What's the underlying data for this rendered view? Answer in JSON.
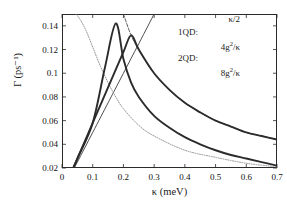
{
  "figure": {
    "background": "#ffffff",
    "axis_color": "#2b2b2b"
  },
  "axes": {
    "xlabel": "κ (meV)",
    "ylabel": "Γ (ps⁻¹)",
    "xticks": [
      "0",
      "0.1",
      "0.2",
      "0.3",
      "0.4",
      "0.5",
      "0.6",
      "0.7"
    ],
    "yticks": [
      "0.02",
      "0.04",
      "0.06",
      "0.08",
      "0.1",
      "0.12",
      "0.14"
    ],
    "xlim": [
      0,
      0.7
    ],
    "ylim": [
      0.02,
      0.15
    ]
  },
  "legend": {
    "group1_label": "1QD:",
    "group2_label": "2QD:",
    "entries": [
      {
        "label": "κ/2",
        "style": "solid-thin",
        "color": "#2b2b2b"
      },
      {
        "label": "4g²/κ",
        "style": "solid-thick",
        "color": "#2b2b2b"
      },
      {
        "label": "8g²/κ",
        "style": "dotted",
        "color": "#6b6b6b"
      }
    ],
    "line_styles": [
      "solid-thin",
      "solid-thick",
      "dotted",
      "dashed"
    ]
  },
  "chart_data": {
    "type": "line",
    "title": "",
    "xlabel": "κ (meV)",
    "ylabel": "Γ (ps⁻¹)",
    "xlim": [
      0,
      0.7
    ],
    "ylim": [
      0.02,
      0.15
    ],
    "grid": false,
    "legend_position": "top-right",
    "series": [
      {
        "name": "κ/2",
        "style": "solid-thin",
        "color": "#3a3a3a",
        "x": [
          0.02,
          0.05,
          0.1,
          0.15,
          0.175,
          0.2,
          0.225,
          0.25,
          0.28,
          0.3
        ],
        "y": [
          0.01,
          0.025,
          0.05,
          0.075,
          0.0875,
          0.1,
          0.1125,
          0.125,
          0.14,
          0.15
        ]
      },
      {
        "name": "1QD: 4g²/κ",
        "style": "dotted",
        "color": "#8a8a8a",
        "x": [
          0.045,
          0.06,
          0.08,
          0.1,
          0.125,
          0.15,
          0.175,
          0.2,
          0.25,
          0.3,
          0.4,
          0.5,
          0.6,
          0.7
        ],
        "y": [
          0.15,
          0.145,
          0.135,
          0.122,
          0.106,
          0.092,
          0.08,
          0.07,
          0.056,
          0.047,
          0.035,
          0.029,
          0.024,
          0.021
        ]
      },
      {
        "name": "1QD envelope",
        "style": "solid-thick",
        "color": "#2b2b2b",
        "x": [
          0.02,
          0.05,
          0.1,
          0.14,
          0.175,
          0.2,
          0.225,
          0.25,
          0.3,
          0.35,
          0.4,
          0.45,
          0.5,
          0.55,
          0.6,
          0.65,
          0.7
        ],
        "y": [
          0.01,
          0.028,
          0.058,
          0.105,
          0.142,
          0.112,
          0.092,
          0.08,
          0.064,
          0.054,
          0.046,
          0.04,
          0.035,
          0.031,
          0.028,
          0.025,
          0.022
        ]
      },
      {
        "name": "2QD: 8g²/κ",
        "style": "dashed",
        "color": "#4a4a4a",
        "x": [
          0.2,
          0.225,
          0.25,
          0.3,
          0.35,
          0.4,
          0.45,
          0.5,
          0.55,
          0.6,
          0.65,
          0.7
        ],
        "y": [
          0.15,
          0.132,
          0.12,
          0.1,
          0.086,
          0.075,
          0.067,
          0.06,
          0.055,
          0.05,
          0.047,
          0.044
        ]
      },
      {
        "name": "2QD envelope",
        "style": "solid-thick",
        "color": "#2b2b2b",
        "x": [
          0.02,
          0.05,
          0.1,
          0.15,
          0.2,
          0.225,
          0.25,
          0.3,
          0.35,
          0.4,
          0.45,
          0.5,
          0.55,
          0.6,
          0.65,
          0.7
        ],
        "y": [
          0.01,
          0.028,
          0.058,
          0.088,
          0.118,
          0.132,
          0.12,
          0.1,
          0.086,
          0.075,
          0.067,
          0.06,
          0.055,
          0.05,
          0.047,
          0.044
        ]
      }
    ]
  }
}
